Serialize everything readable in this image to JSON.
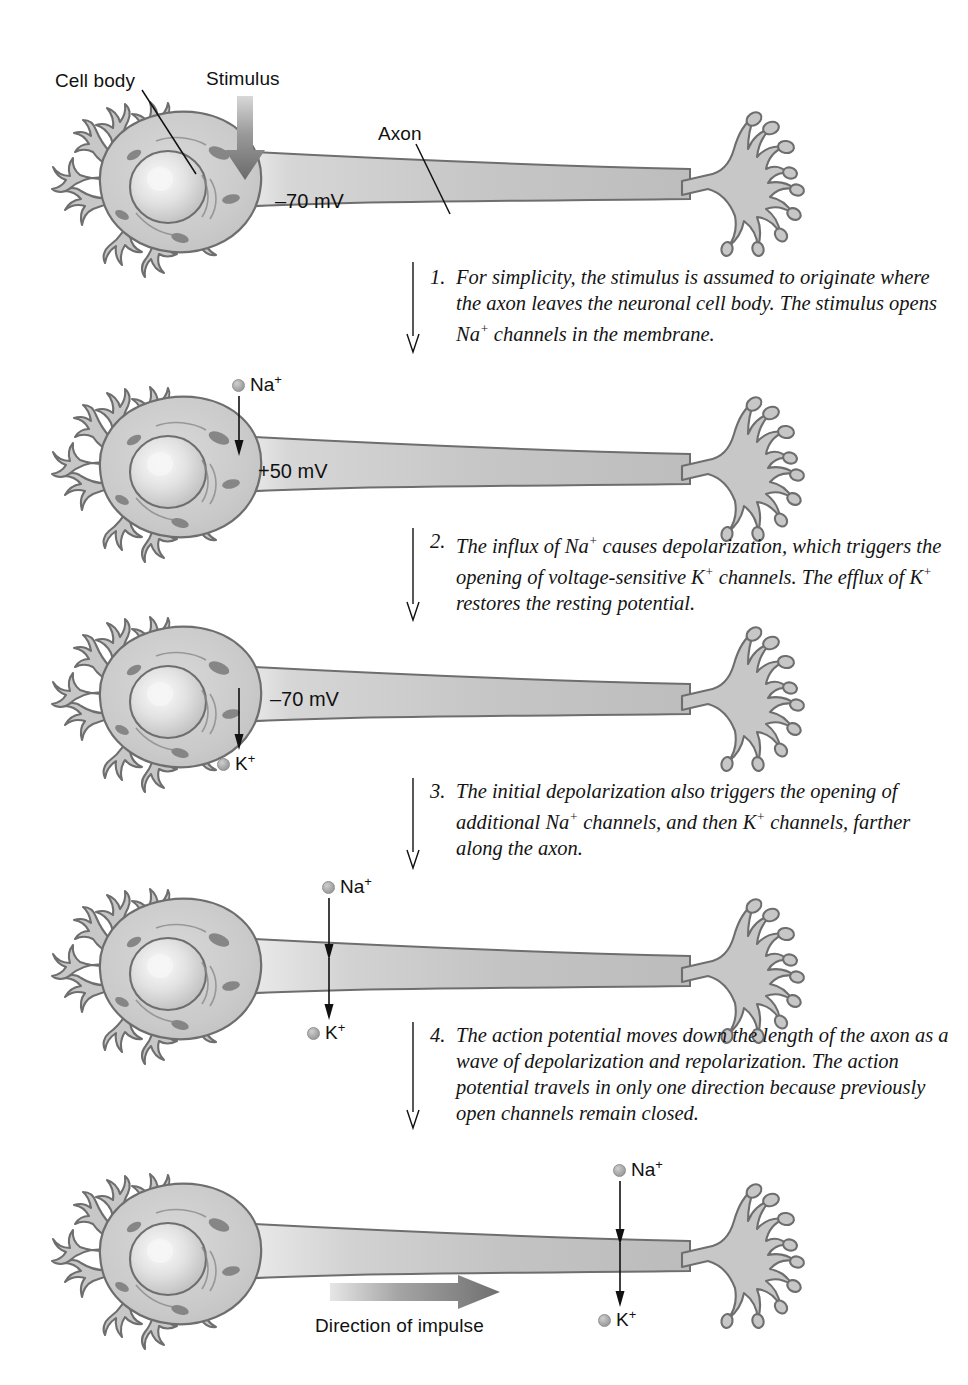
{
  "figure": {
    "background": "#ffffff",
    "ink": "#111111",
    "cell_fill": "#c9c9c9",
    "cell_stroke": "#6e6e6e"
  },
  "annotations": {
    "cell_body": "Cell body",
    "stimulus": "Stimulus",
    "axon": "Axon",
    "direction_of_impulse": "Direction of impulse"
  },
  "ions": {
    "sodium": "Na",
    "sodium_charge": "+",
    "potassium": "K",
    "potassium_charge": "+"
  },
  "panels": [
    {
      "id": "panel-1",
      "name": "resting-state",
      "voltage": "–70 mV",
      "labels": [
        "Cell body",
        "Stimulus",
        "Axon"
      ],
      "ions_shown": []
    },
    {
      "id": "panel-2",
      "name": "depolarization",
      "voltage": "+50 mV",
      "labels": [],
      "ions_shown": [
        "Na+"
      ]
    },
    {
      "id": "panel-3",
      "name": "repolarization",
      "voltage": "–70 mV",
      "labels": [],
      "ions_shown": [
        "K+"
      ]
    },
    {
      "id": "panel-4",
      "name": "propagation-midaxon",
      "voltage": "",
      "labels": [],
      "ions_shown": [
        "Na+",
        "K+"
      ]
    },
    {
      "id": "panel-5",
      "name": "propagation-terminal",
      "voltage": "",
      "labels": [
        "Direction of impulse"
      ],
      "ions_shown": [
        "Na+",
        "K+"
      ]
    }
  ],
  "steps": [
    {
      "number": "1.",
      "text_parts": [
        "For simplicity, the stimulus is assumed to originate where the axon leaves the neuronal cell body. The stimulus opens Na",
        "+",
        " channels in the membrane."
      ],
      "text": "For simplicity, the stimulus is assumed to originate where the axon leaves the neuronal cell body. The stimulus opens Na+ channels in the membrane."
    },
    {
      "number": "2.",
      "text": "The influx of Na+ causes depolarization, which triggers the opening of voltage-sensitive K+ channels. The efflux of K+ restores the resting potential."
    },
    {
      "number": "3.",
      "text": "The initial depolarization also triggers the opening of additional Na+ channels, and then K+ channels, farther along the axon."
    },
    {
      "number": "4.",
      "text": "The action potential moves down the length of the axon as a wave of depolarization and repolarization. The action potential travels in only one direction because previously open channels remain closed."
    }
  ],
  "step_lines": {
    "s1": [
      "For simplicity, the stimulus is assumed to originate",
      "where the axon leaves the neuronal cell body. The",
      "stimulus opens Na⁺ channels in the membrane."
    ],
    "s2": [
      "The influx of Na⁺ causes depolarization, which",
      "triggers the opening of voltage-sensitive K⁺",
      "channels. The efflux of K⁺ restores the resting",
      "potential."
    ],
    "s3": [
      "The initial depolarization also triggers the opening",
      "of additional Na⁺ channels, and then K⁺ channels,",
      "farther along the axon."
    ],
    "s4": [
      "The action potential moves down the length of the",
      "axon as a wave of depolarization and repolarization.",
      "The action potential travels in only one direction",
      "because previously open channels remain closed."
    ]
  }
}
